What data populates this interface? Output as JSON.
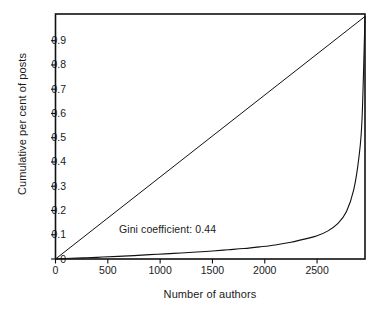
{
  "chart_data": {
    "type": "line",
    "title": "",
    "xlabel": "Number of authors",
    "ylabel": "Cumulative per cent of posts",
    "xlim": [
      0,
      2958
    ],
    "ylim": [
      0,
      1.01
    ],
    "xticks": [
      0,
      500,
      1000,
      1500,
      2000,
      2500
    ],
    "xticklabels": [
      "0",
      "500",
      "1000",
      "1500",
      "2000",
      "2500"
    ],
    "yticks": [
      0,
      0.1,
      0.2,
      0.3,
      0.4,
      0.5,
      0.6,
      0.7,
      0.8,
      0.9
    ],
    "yticklabels": [
      "0",
      "0.1",
      "0.2",
      "0.3",
      "0.4",
      "0.5",
      "0.6",
      "0.7",
      "0.8",
      "0.9"
    ],
    "grid": false,
    "legend": null,
    "annotations": [
      {
        "text": "Gini coefficient: 0.44",
        "x": 1180,
        "y": 0.125
      }
    ],
    "series": [
      {
        "name": "line of equality",
        "style": "straight",
        "x": [
          0,
          2958
        ],
        "y": [
          0,
          1.0
        ]
      },
      {
        "name": "Lorenz curve",
        "style": "curve",
        "x": [
          0,
          150,
          300,
          450,
          600,
          750,
          900,
          1050,
          1200,
          1350,
          1500,
          1650,
          1800,
          1950,
          2100,
          2250,
          2400,
          2500,
          2600,
          2700,
          2780,
          2850,
          2900,
          2930,
          2958
        ],
        "y": [
          0.0,
          0.003,
          0.005,
          0.008,
          0.011,
          0.014,
          0.018,
          0.021,
          0.025,
          0.029,
          0.033,
          0.038,
          0.043,
          0.05,
          0.058,
          0.069,
          0.084,
          0.096,
          0.115,
          0.147,
          0.195,
          0.285,
          0.42,
          0.58,
          1.0
        ]
      }
    ]
  },
  "axes": {
    "frame_color": "#111111",
    "line_color": "#111111"
  }
}
